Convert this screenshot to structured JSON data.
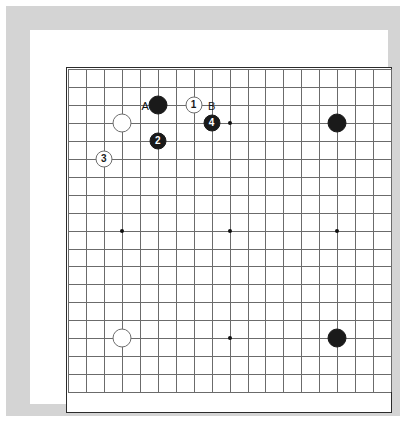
{
  "diagram": {
    "type": "go-board-diagram",
    "board_size": 19,
    "frame_color": "#d4d4d4",
    "mat_color": "#ffffff",
    "board_color": "#ffffff",
    "grid_color": "#6b6b6b",
    "border_color": "#2b2b2b",
    "black_color": "#1a1a1a",
    "white_color": "#ffffff"
  },
  "grid": {
    "origin_x": 1,
    "origin_y": 1,
    "spacing": 17.95,
    "lines": 19,
    "star_points": [
      {
        "col": 4,
        "row": 4
      },
      {
        "col": 10,
        "row": 4
      },
      {
        "col": 16,
        "row": 4
      },
      {
        "col": 4,
        "row": 10
      },
      {
        "col": 10,
        "row": 10
      },
      {
        "col": 16,
        "row": 10
      },
      {
        "col": 4,
        "row": 16
      },
      {
        "col": 10,
        "row": 16
      },
      {
        "col": 16,
        "row": 16
      }
    ]
  },
  "stones": [
    {
      "id": "black-hoshi-top-right",
      "col": 16,
      "row": 4,
      "color": "black",
      "label": "",
      "radius": 9.5
    },
    {
      "id": "black-hoshi-bottom-right",
      "col": 16,
      "row": 16,
      "color": "black",
      "label": "",
      "radius": 9.5
    },
    {
      "id": "white-hoshi-bottom-left",
      "col": 4,
      "row": 16,
      "color": "white",
      "label": "",
      "radius": 9.5
    },
    {
      "id": "black-upper-left-corner",
      "col": 6,
      "row": 3,
      "color": "black",
      "label": "",
      "radius": 9.5
    },
    {
      "id": "white-upper-left-hoshi",
      "col": 4,
      "row": 4,
      "color": "white",
      "label": "",
      "radius": 9.5
    },
    {
      "id": "white-move-1",
      "col": 8,
      "row": 3,
      "color": "white",
      "label": "1",
      "radius": 8.5
    },
    {
      "id": "black-move-2",
      "col": 6,
      "row": 5,
      "color": "black",
      "label": "2",
      "radius": 8.5
    },
    {
      "id": "white-move-3",
      "col": 3,
      "row": 6,
      "color": "white",
      "label": "3",
      "radius": 8.5
    },
    {
      "id": "black-move-4",
      "col": 9,
      "row": 4,
      "color": "black",
      "label": "4",
      "radius": 8.5
    }
  ],
  "markers": [
    {
      "id": "marker-a",
      "col": 5.3,
      "row": 3.05,
      "text": "A"
    },
    {
      "id": "marker-b",
      "col": 9.0,
      "row": 3.05,
      "text": "B"
    }
  ],
  "move_sequence": {
    "moves": [
      {
        "number": "1",
        "color": "white"
      },
      {
        "number": "2",
        "color": "black"
      },
      {
        "number": "3",
        "color": "white"
      },
      {
        "number": "4",
        "color": "black"
      }
    ],
    "reference_points": [
      "A",
      "B"
    ]
  }
}
